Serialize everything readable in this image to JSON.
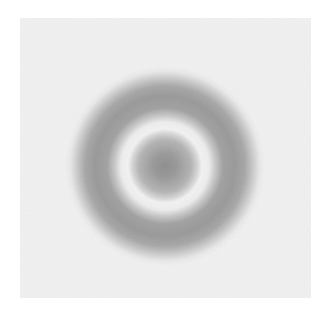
{
  "image": {
    "description": "Grayscale concentric ring pattern: dark center disk, bright ring, dark outer ring on a light gray noisy background",
    "background_color": "#e4e4e4",
    "page_color": "#ffffff",
    "pattern": {
      "center": [
        145,
        148
      ],
      "central_disk_radius": 33,
      "bright_ring_outer_radius": 49,
      "dark_ring_outer_radius": 90,
      "colors": {
        "center_dark": "#2a2a2a",
        "disk_edge": "#6a6a6a",
        "bright_ring": "#e6e6e6",
        "dark_ring": "#3c3c3c"
      }
    }
  }
}
